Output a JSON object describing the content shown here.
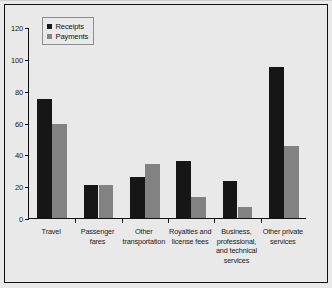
{
  "chart_data": {
    "type": "bar",
    "title": "",
    "subtitle": "",
    "xlabel": "",
    "ylabel": "",
    "ylim": [
      0,
      120
    ],
    "yticks": [
      0,
      20,
      40,
      60,
      80,
      100,
      120
    ],
    "ytick_labels": [
      "0",
      "20",
      "40",
      "60",
      "80",
      "100",
      "120"
    ],
    "grid": false,
    "legend_position": "top-left",
    "categories": [
      "Travel",
      "Passenger fares",
      "Other transportation",
      "Royalties and license fees",
      "Business, professional, and technical services",
      "Other private services"
    ],
    "category_lines": [
      [
        "Travel"
      ],
      [
        "Passenger",
        "fares"
      ],
      [
        "Other",
        "transportation"
      ],
      [
        "Royalties and",
        "license fees"
      ],
      [
        "Business,",
        "professional,",
        "and technical",
        "services"
      ],
      [
        "Other private",
        "services"
      ]
    ],
    "series": [
      {
        "name": "Receipts",
        "color": "#161616",
        "values": [
          75,
          21,
          26,
          36,
          23,
          95
        ]
      },
      {
        "name": "Payments",
        "color": "#828282",
        "values": [
          59,
          21,
          34,
          13,
          7,
          45
        ]
      }
    ]
  },
  "legend": {
    "items": [
      {
        "label": "Receipts",
        "color": "#161616"
      },
      {
        "label": "Payments",
        "color": "#828282"
      }
    ]
  },
  "colors": {
    "receipts": "#161616",
    "payments": "#828282",
    "axis": "#111111",
    "background": "#e9e9e9",
    "frame": "#111111"
  }
}
